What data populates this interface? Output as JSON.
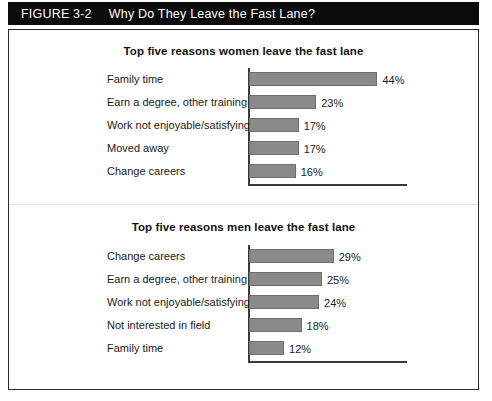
{
  "figure": {
    "number": "FIGURE 3-2",
    "title": "Why Do They Leave the Fast Lane?"
  },
  "colors": {
    "header_background": "#0b0b0b",
    "header_text": "#ffffff",
    "panel_border": "#2a2a2a",
    "bar_fill": "#8a8a8a",
    "bar_stroke": "#6d6d6d",
    "axis": "#3a3a3a",
    "text": "#1a1a1a"
  },
  "chart_data": [
    {
      "type": "bar",
      "orientation": "horizontal",
      "id": "women",
      "title": "Top five reasons women leave the fast lane",
      "xlabel": "",
      "ylabel": "",
      "xlim": [
        0,
        55
      ],
      "grid": false,
      "legend": "none",
      "value_suffix": "%",
      "categories": [
        "Family time",
        "Earn a degree, other training",
        "Work not enjoyable/satisfying",
        "Moved away",
        "Change careers"
      ],
      "values": [
        44,
        23,
        17,
        17,
        16
      ],
      "value_labels": [
        "44%",
        "23%",
        "17%",
        "17%",
        "16%"
      ]
    },
    {
      "type": "bar",
      "orientation": "horizontal",
      "id": "men",
      "title": "Top five reasons men leave the fast lane",
      "xlabel": "",
      "ylabel": "",
      "xlim": [
        0,
        55
      ],
      "grid": false,
      "legend": "none",
      "value_suffix": "%",
      "categories": [
        "Change careers",
        "Earn a degree, other training",
        "Work not enjoyable/satisfying",
        "Not interested in field",
        "Family time"
      ],
      "values": [
        29,
        25,
        24,
        18,
        12
      ],
      "value_labels": [
        "29%",
        "25%",
        "24%",
        "18%",
        "12%"
      ]
    }
  ]
}
